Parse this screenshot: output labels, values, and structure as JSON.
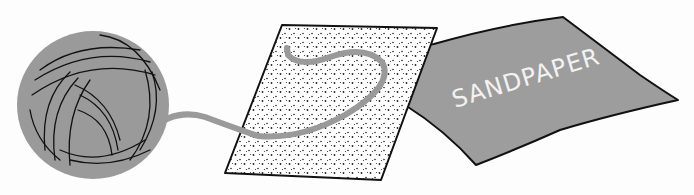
{
  "illustration": {
    "objects": [
      {
        "name": "ball of yarn",
        "color": "#9a9a9a"
      },
      {
        "name": "dotted sheet",
        "color": "#ffffff"
      },
      {
        "name": "sandpaper",
        "color": "#9d9d9d",
        "label": "SANDPAPER"
      }
    ],
    "colors": {
      "ink": "#111111",
      "gray": "#9a9a9a",
      "text": "#f2f2f2"
    }
  }
}
